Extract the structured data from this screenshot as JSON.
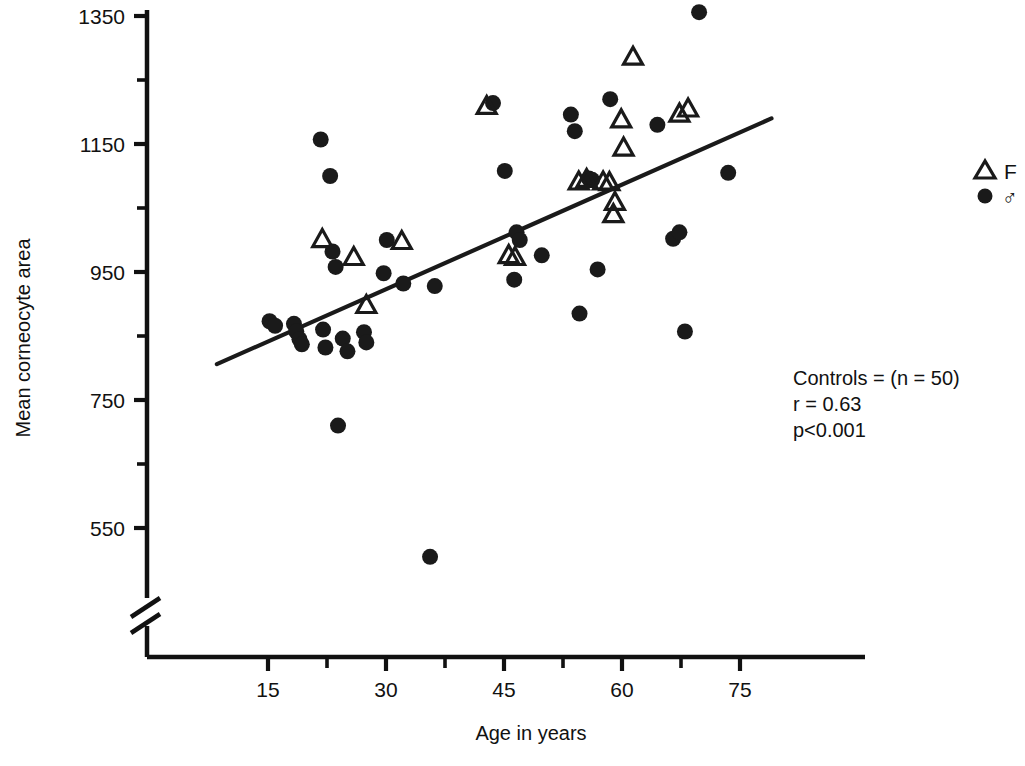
{
  "chart_data": {
    "type": "scatter",
    "title": "",
    "xlabel": "Age in years",
    "ylabel": "Mean corneocyte area",
    "xlim": [
      5,
      82
    ],
    "ylim": [
      520,
      1380
    ],
    "xticks": [
      15,
      30,
      45,
      60,
      75
    ],
    "xtick_labels": [
      "15",
      "30",
      "45",
      "60",
      "75"
    ],
    "xminor_ticks": [
      22.5,
      37.5,
      52.5,
      67.5
    ],
    "yticks": [
      550,
      750,
      950,
      1150,
      1350
    ],
    "ytick_labels": [
      "550",
      "750",
      "950",
      "1150",
      "1350"
    ],
    "yminor_ticks": [
      650,
      850,
      1050,
      1250
    ],
    "grid": false,
    "axis_break": {
      "axis": "y",
      "present": true,
      "note": "double-slash break below 550 near origin"
    },
    "legend": {
      "position": "right",
      "entries": [
        {
          "marker": "open-triangle",
          "label": "F"
        },
        {
          "marker": "filled-circle",
          "label": "♂"
        }
      ]
    },
    "annotations": [
      "Controls = (n = 50)",
      "r = 0.63",
      "p<0.001"
    ],
    "regression_line": {
      "x": [
        8.5,
        79.0
      ],
      "y": [
        806,
        1190
      ],
      "r": 0.63,
      "p": "<0.001"
    },
    "series": [
      {
        "name": "♂",
        "marker": "filled-circle",
        "points": [
          [
            15.2,
            873
          ],
          [
            15.9,
            866
          ],
          [
            18.3,
            869
          ],
          [
            18.6,
            857
          ],
          [
            19.0,
            845
          ],
          [
            19.3,
            837
          ],
          [
            21.7,
            1157
          ],
          [
            22.0,
            860
          ],
          [
            22.3,
            832
          ],
          [
            22.9,
            1100
          ],
          [
            23.2,
            982
          ],
          [
            23.6,
            958
          ],
          [
            23.9,
            710
          ],
          [
            24.5,
            846
          ],
          [
            25.1,
            826
          ],
          [
            27.2,
            856
          ],
          [
            27.5,
            840
          ],
          [
            29.7,
            948
          ],
          [
            30.1,
            1000
          ],
          [
            32.2,
            932
          ],
          [
            35.6,
            505
          ],
          [
            36.2,
            928
          ],
          [
            43.6,
            1214
          ],
          [
            45.1,
            1108
          ],
          [
            46.3,
            938
          ],
          [
            46.6,
            1012
          ],
          [
            47.0,
            1000
          ],
          [
            49.8,
            976
          ],
          [
            53.5,
            1196
          ],
          [
            54.0,
            1170
          ],
          [
            54.6,
            885
          ],
          [
            55.8,
            1096
          ],
          [
            56.2,
            1094
          ],
          [
            56.9,
            954
          ],
          [
            58.5,
            1220
          ],
          [
            64.5,
            1180
          ],
          [
            66.5,
            1002
          ],
          [
            67.3,
            1012
          ],
          [
            68.0,
            857
          ],
          [
            69.8,
            1356
          ],
          [
            73.5,
            1105
          ]
        ]
      },
      {
        "name": "F",
        "marker": "open-triangle",
        "points": [
          [
            21.9,
            1003
          ],
          [
            25.9,
            975
          ],
          [
            27.5,
            900
          ],
          [
            32.0,
            1000
          ],
          [
            42.8,
            1211
          ],
          [
            45.6,
            978
          ],
          [
            46.4,
            975
          ],
          [
            54.5,
            1093
          ],
          [
            55.5,
            1097
          ],
          [
            57.6,
            1093
          ],
          [
            58.4,
            1092
          ],
          [
            58.9,
            1042
          ],
          [
            59.1,
            1061
          ],
          [
            59.9,
            1190
          ],
          [
            60.2,
            1146
          ],
          [
            61.4,
            1288
          ],
          [
            67.3,
            1199
          ],
          [
            68.4,
            1207
          ]
        ]
      }
    ]
  },
  "legend": {
    "female_label": "F",
    "male_label": "♂"
  },
  "annotation": {
    "line1": "Controls = (n = 50)",
    "line2": "r = 0.63",
    "line3": "p<0.001"
  },
  "axes": {
    "x_title": "Age in years",
    "y_title": "Mean corneocyte area"
  }
}
